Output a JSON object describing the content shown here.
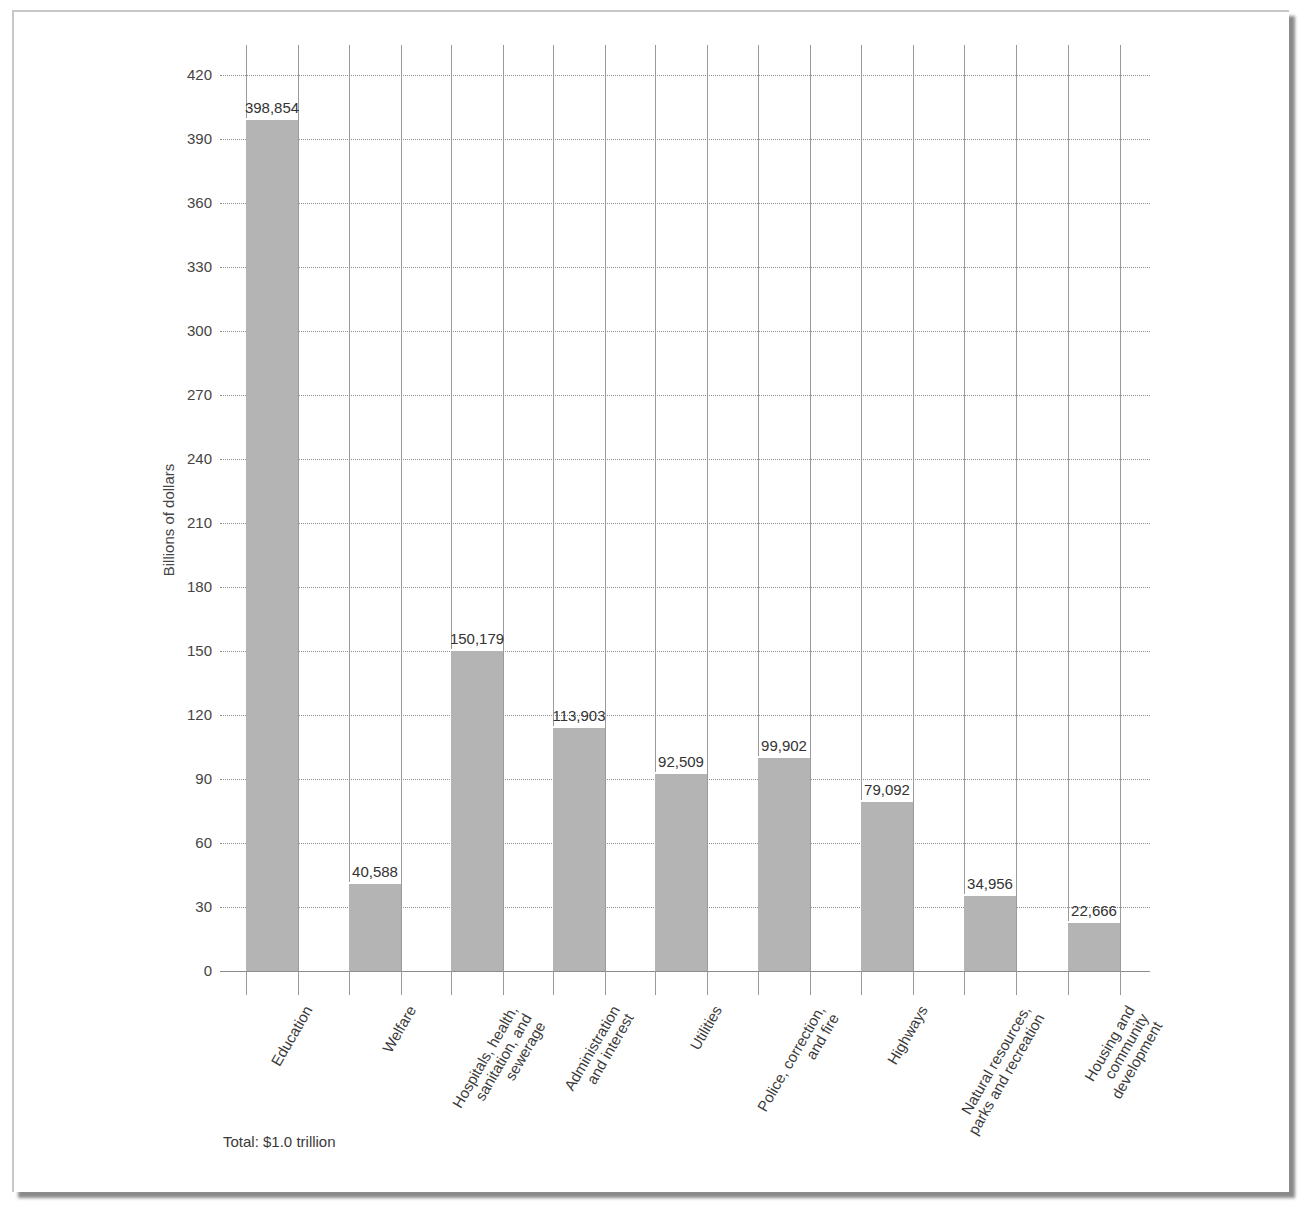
{
  "chart_data": {
    "type": "bar",
    "title": "",
    "xlabel": "",
    "ylabel": "Billions of dollars",
    "ylim": [
      0,
      420
    ],
    "yticks": [
      0,
      30,
      60,
      90,
      120,
      150,
      180,
      210,
      240,
      270,
      300,
      330,
      360,
      390,
      420
    ],
    "grid": true,
    "categories": [
      "Education",
      "Welfare",
      "Hospitals, health, sanitation, and sewerage",
      "Administration and interest",
      "Utilities",
      "Police, correction, and fire",
      "Highways",
      "Natural resources, parks and recreation",
      "Housing and community development"
    ],
    "values": [
      398.854,
      40.588,
      150.179,
      113.903,
      92.509,
      99.902,
      79.092,
      34.956,
      22.666
    ],
    "value_labels": [
      "398,854",
      "40,588",
      "150,179",
      "113,903",
      "92,509",
      "99,902",
      "79,092",
      "34,956",
      "22,666"
    ],
    "annotations": [
      "Total: $1.0 trillion"
    ],
    "bar_color": "#b4b4b4"
  },
  "labels": {
    "ylabel": "Billions of dollars",
    "total": "Total: $1.0 trillion",
    "yticks": [
      "0",
      "30",
      "60",
      "90",
      "120",
      "150",
      "180",
      "210",
      "240",
      "270",
      "300",
      "330",
      "360",
      "390",
      "420"
    ],
    "xcats": [
      "Education",
      "Welfare",
      "Hospitals, health,\nsanitation, and\nsewerage",
      "Administration\nand interest",
      "Utilities",
      "Police, correction,\nand fire",
      "Highways",
      "Natural resources,\nparks and recreation",
      "Housing and\ncommunity\ndevelopment"
    ]
  }
}
